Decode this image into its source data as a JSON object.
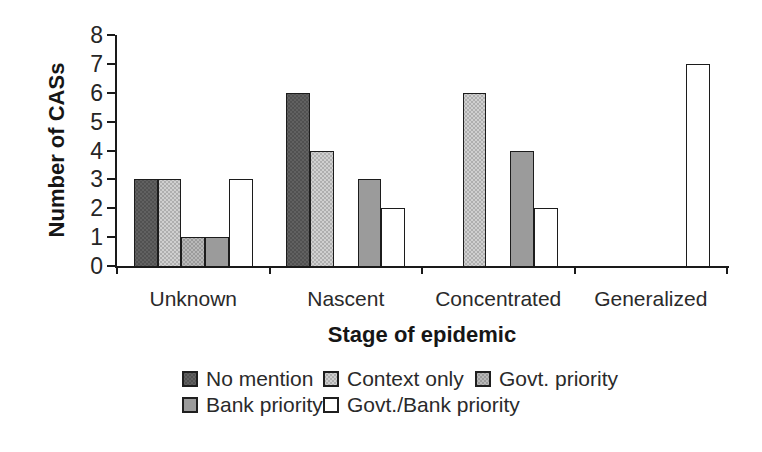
{
  "figure": {
    "background": "#ffffff",
    "axis_color": "#1a1a1a",
    "text_color": "#1e1e1e"
  },
  "chart_data": {
    "type": "bar",
    "title": "",
    "xlabel": "Stage of epidemic",
    "ylabel": "Number of CASs",
    "categories": [
      "Unknown",
      "Nascent",
      "Concentrated",
      "Generalized"
    ],
    "series": [
      {
        "name": "No mention",
        "color": "#616161",
        "pattern": "dots",
        "values": [
          3,
          6,
          0,
          0
        ]
      },
      {
        "name": "Context only",
        "color": "#d0d0d0",
        "pattern": "dots",
        "values": [
          3,
          4,
          6,
          0
        ]
      },
      {
        "name": "Govt. priority",
        "color": "#b9b9b9",
        "pattern": "dots",
        "values": [
          1,
          0,
          0,
          0
        ]
      },
      {
        "name": "Bank priority",
        "color": "#9b9b9b",
        "pattern": "none",
        "values": [
          1,
          3,
          4,
          0
        ]
      },
      {
        "name": "Govt./Bank priority",
        "color": "#ffffff",
        "pattern": "none",
        "values": [
          3,
          2,
          2,
          7
        ]
      }
    ],
    "ylim": [
      0,
      8
    ],
    "yticks": [
      0,
      1,
      2,
      3,
      4,
      5,
      6,
      7,
      8
    ],
    "grid": false,
    "legend_position": "bottom",
    "legend_rows": [
      [
        "No mention",
        "Context only",
        "Govt. priority"
      ],
      [
        "Bank priority",
        "Govt./Bank priority"
      ]
    ]
  }
}
